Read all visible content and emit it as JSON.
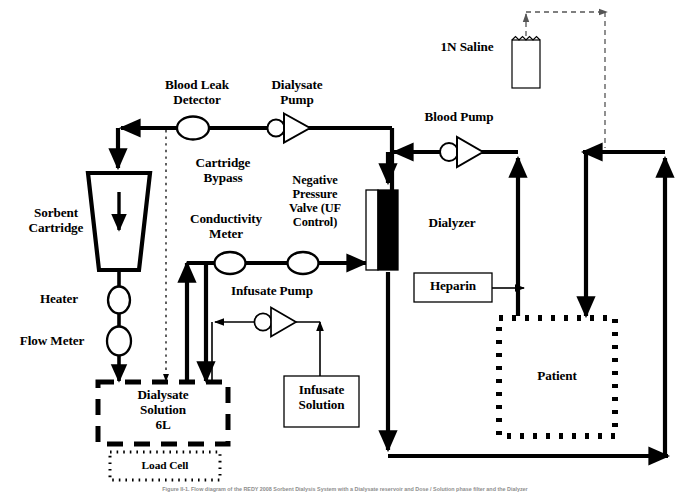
{
  "figure": {
    "caption": "Figure  II-1.  Flow diagram of the REDY 2008 Sorbent Dialysis System with a Dialysate reservoir and Dose / Solution phase filter and the Dialyzer",
    "bg_color": "#ffffff",
    "line_color": "#000000"
  },
  "labels": {
    "sorbent_cartridge": "Sorbent\nCartridge",
    "blood_leak_detector": "Blood Leak\nDetector",
    "dialysate_pump": "Dialysate\nPump",
    "cartridge_bypass": "Cartridge\nBypass",
    "conductivity_meter": "Conductivity\nMeter",
    "negative_pressure_valve": "Negative\nPressure\nValve (UF\nControl)",
    "blood_pump": "Blood Pump",
    "saline": "1N Saline",
    "dialyzer": "Dialyzer",
    "heparin": "Heparin",
    "patient": "Patient",
    "heater": "Heater",
    "flow_meter": "Flow Meter",
    "infusate_pump": "Infusate Pump",
    "infusate_solution": "Infusate\nSolution",
    "dialysate_solution": "Dialysate\nSolution\n6L",
    "load_cell": "Load Cell"
  },
  "components": [
    {
      "id": "sorbent-cartridge",
      "type": "trapezoid",
      "label": "Sorbent Cartridge"
    },
    {
      "id": "blood-leak-detector",
      "type": "ellipse-sensor",
      "label": "Blood Leak Detector"
    },
    {
      "id": "dialysate-pump",
      "type": "pump",
      "label": "Dialysate Pump",
      "flow": "right"
    },
    {
      "id": "conductivity-meter",
      "type": "ellipse-sensor",
      "label": "Conductivity Meter"
    },
    {
      "id": "negative-pressure-valve",
      "type": "ellipse-sensor",
      "label": "Negative Pressure Valve (UF Control)"
    },
    {
      "id": "blood-pump",
      "type": "pump",
      "label": "Blood Pump",
      "flow": "left"
    },
    {
      "id": "infusate-pump",
      "type": "pump",
      "label": "Infusate Pump",
      "flow": "left"
    },
    {
      "id": "dialyzer",
      "type": "split-rect",
      "label": "Dialyzer"
    },
    {
      "id": "saline-bag",
      "type": "container",
      "label": "1N Saline"
    },
    {
      "id": "heparin-box",
      "type": "box",
      "label": "Heparin"
    },
    {
      "id": "patient-box",
      "type": "dotted-box",
      "label": "Patient"
    },
    {
      "id": "heater",
      "type": "ellipse-sensor",
      "label": "Heater"
    },
    {
      "id": "flow-meter",
      "type": "ellipse-sensor",
      "label": "Flow Meter"
    },
    {
      "id": "infusate-solution-box",
      "type": "box",
      "label": "Infusate Solution"
    },
    {
      "id": "dialysate-solution-box",
      "type": "dashed-box",
      "label": "Dialysate Solution 6L"
    },
    {
      "id": "load-cell-box",
      "type": "dotted-box",
      "label": "Load Cell"
    }
  ]
}
